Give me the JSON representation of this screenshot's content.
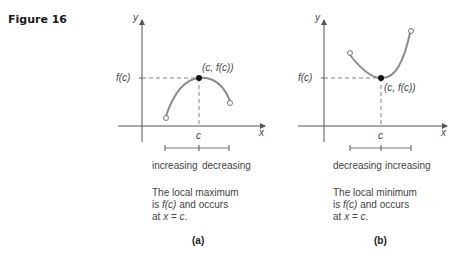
{
  "figure": {
    "label": "Figure 16"
  },
  "panels": [
    {
      "id": "a",
      "caption": "(a)",
      "y_axis_label": "y",
      "x_axis_label": "x",
      "fc_label": "f(c)",
      "c_label": "c",
      "point_label": "(c, f(c))",
      "interval_left": "increasing",
      "interval_right": "decreasing",
      "desc_line1": "The local maximum",
      "desc_line2_pre": "is ",
      "desc_line2_fc": "f(c)",
      "desc_line2_post": " and occurs",
      "desc_line3_pre": "at ",
      "desc_line3_x": "x",
      "desc_line3_eq": " = ",
      "desc_line3_c": "c",
      "desc_line3_end": "."
    },
    {
      "id": "b",
      "caption": "(b)",
      "y_axis_label": "y",
      "x_axis_label": "x",
      "fc_label": "f(c)",
      "c_label": "c",
      "point_label": "(c, f(c))",
      "interval_left": "decreasing",
      "interval_right": "increasing",
      "desc_line1": "The local minimum",
      "desc_line2_pre": "is ",
      "desc_line2_fc": "f(c)",
      "desc_line2_post": " and occurs",
      "desc_line3_pre": "at ",
      "desc_line3_x": "x",
      "desc_line3_eq": " = ",
      "desc_line3_c": "c",
      "desc_line3_end": "."
    }
  ],
  "colors": {
    "curve": "#8a8a8a",
    "axis": "#555555",
    "dash": "#666666",
    "point": "#111111"
  }
}
